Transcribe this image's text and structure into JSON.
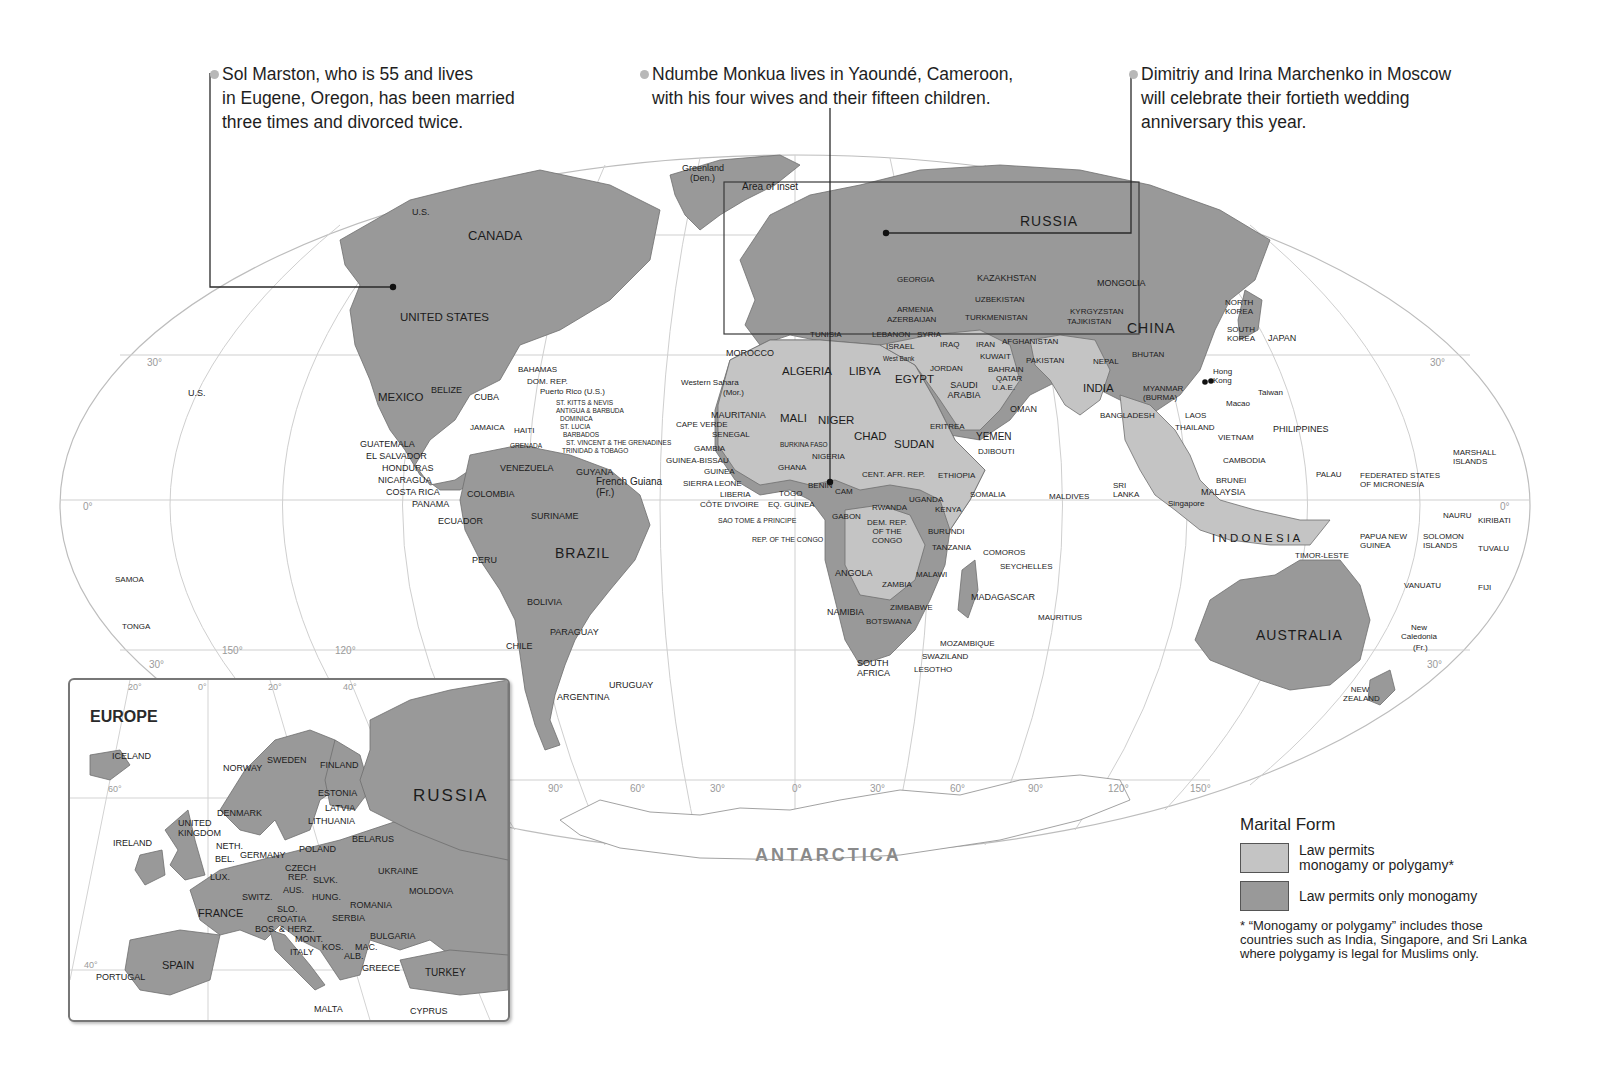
{
  "callouts": [
    {
      "id": "marston",
      "lines": [
        "Sol Marston, who is 55 and lives",
        "in Eugene, Oregon, has been married",
        "three times and divorced twice."
      ]
    },
    {
      "id": "monkua",
      "lines": [
        "Ndumbe Monkua lives in Yaoundé, Cameroon,",
        "with his four wives and their fifteen children."
      ]
    },
    {
      "id": "marchenko",
      "lines": [
        "Dimitriy and Irina Marchenko in Moscow",
        "will celebrate their fortieth wedding",
        "anniversary this year."
      ]
    }
  ],
  "legend": {
    "title": "Marital Form",
    "items": [
      {
        "label_1": "Law permits",
        "label_2": "monogamy or polygamy*",
        "color": "#c4c4c4"
      },
      {
        "label": "Law permits only monogamy",
        "color": "#999999"
      }
    ],
    "note": "* “Monogamy or polygamy” includes those countries such as India, Singapore, and Sri Lanka where polygamy is legal for Muslims only."
  },
  "colors": {
    "polygamy_permitted": "#c4c4c4",
    "monogamy_only": "#999999",
    "ocean": "#ffffff",
    "graticule": "#c8c8c8"
  },
  "map": {
    "area_of_inset": "Area of inset",
    "antarctica": "ANTARCTICA",
    "graticule": {
      "lat": [
        "30°",
        "0°",
        "30°",
        "30°",
        "0°",
        "30°"
      ],
      "lon": [
        "150°",
        "120°",
        "90°",
        "60°",
        "30°",
        "0°",
        "30°",
        "60°",
        "90°",
        "120°",
        "150°"
      ]
    },
    "labels": {
      "greenland": "Greenland",
      "greenland_den": "(Den.)",
      "us_alaska": "U.S.",
      "canada": "CANADA",
      "united_states": "UNITED STATES",
      "us_hawaii": "U.S.",
      "mexico": "MEXICO",
      "belize": "BELIZE",
      "cuba": "CUBA",
      "bahamas": "BAHAMAS",
      "dom_rep": "DOM. REP.",
      "puerto_rico": "Puerto Rico (U.S.)",
      "st_kitts": "ST. KITTS & NEVIS",
      "antigua": "ANTIGUA & BARBUDA",
      "dominica": "DOMINICA",
      "st_lucia": "ST. LUCIA",
      "barbados": "BARBADOS",
      "st_vincent": "ST. VINCENT & THE GRENADINES",
      "trinidad": "TRINIDAD & TOBAGO",
      "grenada": "GRENADA",
      "jamaica": "JAMAICA",
      "haiti": "HAITI",
      "guatemala": "GUATEMALA",
      "el_salvador": "EL SALVADOR",
      "honduras": "HONDURAS",
      "nicaragua": "NICARAGUA",
      "costa_rica": "COSTA RICA",
      "panama": "PANAMA",
      "venezuela": "VENEZUELA",
      "guyana": "GUYANA",
      "french_guiana": "French Guiana",
      "french_guiana_fr": "(Fr.)",
      "colombia": "COLOMBIA",
      "suriname": "SURINAME",
      "ecuador": "ECUADOR",
      "peru": "PERU",
      "brazil": "BRAZIL",
      "bolivia": "BOLIVIA",
      "paraguay": "PARAGUAY",
      "chile": "CHILE",
      "uruguay": "URUGUAY",
      "argentina": "ARGENTINA",
      "samoa": "SAMOA",
      "tonga": "TONGA",
      "morocco": "MOROCCO",
      "western_sahara": "Western Sahara",
      "western_sahara_mor": "(Mor.)",
      "algeria": "ALGERIA",
      "libya": "LIBYA",
      "egypt": "EGYPT",
      "tunisia": "TUNISIA",
      "mauritania": "MAURITANIA",
      "mali": "MALI",
      "niger": "NIGER",
      "chad": "CHAD",
      "sudan": "SUDAN",
      "eritrea": "ERITREA",
      "cape_verde": "CAPE VERDE",
      "senegal": "SENEGAL",
      "gambia": "GAMBIA",
      "guinea_bissau": "GUINEA-BISSAU",
      "guinea": "GUINEA",
      "sierra_leone": "SIERRA LEONE",
      "liberia": "LIBERIA",
      "cote_divoire": "CÔTE D'IVOIRE",
      "burkina_faso": "BURKINA FASO",
      "ghana": "GHANA",
      "togo": "TOGO",
      "benin": "BENIN",
      "nigeria": "NIGERIA",
      "cam": "CAM",
      "eq_guinea": "EQ. GUINEA",
      "sao_tome": "SAO TOME & PRINCIPE",
      "gabon": "GABON",
      "rep_congo": "REP. OF THE CONGO",
      "cent_afr_rep": "CENT. AFR. REP.",
      "ethiopia": "ETHIOPIA",
      "djibouti": "DJIBOUTI",
      "somalia": "SOMALIA",
      "uganda": "UGANDA",
      "kenya": "KENYA",
      "rwanda": "RWANDA",
      "burundi": "BURUNDI",
      "dem_rep_congo": "DEM. REP. OF THE CONGO",
      "tanzania": "TANZANIA",
      "angola": "ANGOLA",
      "zambia": "ZAMBIA",
      "malawi": "MALAWI",
      "comoros": "COMOROS",
      "seychelles": "SEYCHELLES",
      "madagascar": "MADAGASCAR",
      "mauritius": "MAURITIUS",
      "namibia": "NAMIBIA",
      "zimbabwe": "ZIMBABWE",
      "botswana": "BOTSWANA",
      "mozambique": "MOZAMBIQUE",
      "swaziland": "SWAZILAND",
      "lesotho": "LESOTHO",
      "south_africa": "SOUTH AFRICA",
      "russia": "RUSSIA",
      "georgia": "GEORGIA",
      "armenia": "ARMENIA",
      "azerbaijan": "AZERBAIJAN",
      "kazakhstan": "KAZAKHSTAN",
      "uzbekistan": "UZBEKISTAN",
      "turkmenistan": "TURKMENISTAN",
      "kyrgyzstan": "KYRGYZSTAN",
      "tajikistan": "TAJIKISTAN",
      "mongolia": "MONGOLIA",
      "china": "CHINA",
      "north_korea": "NORTH KOREA",
      "south_korea": "SOUTH KOREA",
      "japan": "JAPAN",
      "lebanon": "LEBANON",
      "syria": "SYRIA",
      "israel": "ISRAEL",
      "west_bank": "West Bank",
      "iraq": "IRAQ",
      "jordan": "JORDAN",
      "iran": "IRAN",
      "afghanistan": "AFGHANISTAN",
      "kuwait": "KUWAIT",
      "bahrain": "BAHRAIN",
      "qatar": "QATAR",
      "uae": "U.A.E.",
      "saudi_arabia": "SAUDI ARABIA",
      "yemen": "YEMEN",
      "oman": "OMAN",
      "pakistan": "PAKISTAN",
      "nepal": "NEPAL",
      "bhutan": "BHUTAN",
      "india": "INDIA",
      "bangladesh": "BANGLADESH",
      "myanmar": "MYANMAR (BURMA)",
      "laos": "LAOS",
      "thailand": "THAILAND",
      "vietnam": "VIETNAM",
      "cambodia": "CAMBODIA",
      "hong_kong": "Hong Kong",
      "macao": "Macao",
      "taiwan": "Taiwan",
      "philippines": "PHILIPPINES",
      "sri_lanka": "SRI LANKA",
      "maldives": "MALDIVES",
      "brunei": "BRUNEI",
      "malaysia": "MALAYSIA",
      "singapore": "Singapore",
      "indonesia": "I N D O N E S I A",
      "timor_leste": "TIMOR-LESTE",
      "papua_new_guinea": "PAPUA NEW GUINEA",
      "palau": "PALAU",
      "micronesia": "FEDERATED STATES OF MICRONESIA",
      "marshall_islands": "MARSHALL ISLANDS",
      "nauru": "NAURU",
      "kiribati": "KIRIBATI",
      "solomon_islands": "SOLOMON ISLANDS",
      "tuvalu": "TUVALU",
      "vanuatu": "VANUATU",
      "fiji": "FIJI",
      "new_caledonia": "New Caledonia",
      "new_caledonia_fr": "(Fr.)",
      "australia": "AUSTRALIA",
      "new_zealand": "NEW ZEALAND"
    }
  },
  "inset": {
    "title": "EUROPE",
    "graticule": [
      "20°",
      "0°",
      "20°",
      "40°",
      "60°",
      "40°"
    ],
    "labels": {
      "iceland": "ICELAND",
      "norway": "NORWAY",
      "sweden": "SWEDEN",
      "finland": "FINLAND",
      "russia": "RUSSIA",
      "estonia": "ESTONIA",
      "latvia": "LATVIA",
      "lithuania": "LITHUANIA",
      "denmark": "DENMARK",
      "united_kingdom": "UNITED KINGDOM",
      "ireland": "IRELAND",
      "neth": "NETH.",
      "bel": "BEL.",
      "lux": "LUX.",
      "germany": "GERMANY",
      "poland": "POLAND",
      "belarus": "BELARUS",
      "czech_rep": "CZECH REP.",
      "slvk": "SLVK.",
      "aus": "AUS.",
      "hung": "HUNG.",
      "ukraine": "UKRAINE",
      "moldova": "MOLDOVA",
      "switz": "SWITZ.",
      "france": "FRANCE",
      "slo": "SLO.",
      "croatia": "CROATIA",
      "bos_herz": "BOS. & HERZ.",
      "mont": "MONT.",
      "kos": "KOS.",
      "alb": "ALB.",
      "mac": "MAC.",
      "serbia": "SERBIA",
      "romania": "ROMANIA",
      "bulgaria": "BULGARIA",
      "italy": "ITALY",
      "greece": "GREECE",
      "turkey": "TURKEY",
      "spain": "SPAIN",
      "portugal": "PORTUGAL",
      "malta": "MALTA",
      "cyprus": "CYPRUS"
    }
  }
}
